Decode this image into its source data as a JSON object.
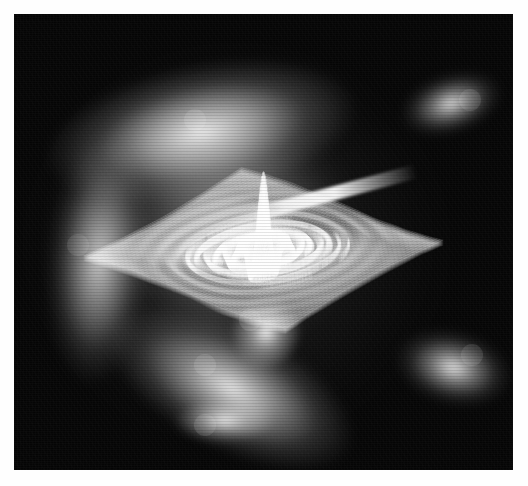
{
  "figure": {
    "title": "",
    "caption": "",
    "domain": "Chart",
    "render_style": "dense wireframe / hedgehog mesh, grayscale, no axes, no labels",
    "canvas": {
      "background_color": "#050505",
      "page_background_color": "#ffffff",
      "line_color": "#ffffff",
      "margin_left_px": 14,
      "margin_top_px": 14,
      "margin_right_px": 15,
      "margin_bottom_px": 16,
      "plot_width_px": 499,
      "plot_height_px": 456
    },
    "annotations": []
  },
  "chart_data": {
    "type": "line",
    "title": "",
    "subtitle": "",
    "xlabel": "",
    "ylabel": "",
    "zlabel": "",
    "grid": false,
    "legend": false,
    "legend_position": "none",
    "axes_visible": false,
    "tick_labels_visible": false,
    "projection": "3d-surface-mesh",
    "colormap": "grayscale",
    "mesh": {
      "u_samples": 220,
      "v_samples": 220,
      "stroke_width_px": 0.45,
      "stroke_opacity": 0.5
    },
    "surface_model": {
      "function": "z = sin(r) / r  ripple modulated by anisotropic decay",
      "x_range": [
        -12,
        12
      ],
      "y_range": [
        -12,
        12
      ],
      "z_range": [
        -1,
        1
      ],
      "ripple_count": 7,
      "ripple_spacing_px": 26
    },
    "view": {
      "azimuth_deg": 38,
      "elevation_deg": 26,
      "roll_deg": 0
    },
    "features": [
      {
        "name": "upper-left-crest",
        "x": 195,
        "y": 120,
        "brightness": 0.95
      },
      {
        "name": "left-wall-ridge",
        "x": 78,
        "y": 245,
        "brightness": 0.82
      },
      {
        "name": "bottom-left-ridge",
        "x": 205,
        "y": 365,
        "brightness": 0.9
      },
      {
        "name": "saddle-center",
        "x": 265,
        "y": 215,
        "brightness": 0.7
      },
      {
        "name": "upper-right-spike",
        "x": 470,
        "y": 100,
        "brightness": 0.88
      },
      {
        "name": "lower-right-spike",
        "x": 472,
        "y": 355,
        "brightness": 0.9
      },
      {
        "name": "bottom-apex",
        "x": 205,
        "y": 425,
        "brightness": 0.92
      },
      {
        "name": "fold-notch",
        "x": 250,
        "y": 320,
        "brightness": 0.95
      }
    ],
    "intensity_profile": {
      "background_gray": 5,
      "dim_mesh_gray": 60,
      "mid_mesh_gray": 140,
      "bright_ridge_gray": 250
    }
  }
}
